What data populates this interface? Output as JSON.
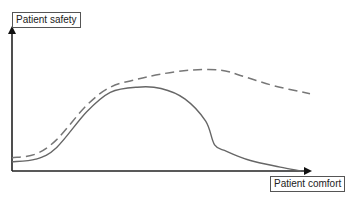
{
  "chart_data": {
    "type": "line",
    "title": "",
    "xlabel": "Patient comfort",
    "ylabel": "Patient safety",
    "grid": false,
    "legend": null,
    "axis_ticks": false,
    "x_range": [
      0,
      1
    ],
    "y_range": [
      0,
      1
    ],
    "series": [
      {
        "name": "solid curve",
        "style": "solid",
        "color": "#666666",
        "x": [
          0.0,
          0.08,
          0.15,
          0.25,
          0.33,
          0.42,
          0.5,
          0.58,
          0.65,
          0.68,
          0.72,
          0.8,
          0.9,
          0.97
        ],
        "y": [
          0.07,
          0.09,
          0.18,
          0.45,
          0.6,
          0.64,
          0.63,
          0.55,
          0.38,
          0.2,
          0.15,
          0.08,
          0.03,
          0.0
        ]
      },
      {
        "name": "dashed curve",
        "style": "dashed",
        "color": "#777777",
        "x": [
          0.0,
          0.08,
          0.15,
          0.25,
          0.33,
          0.42,
          0.5,
          0.6,
          0.7,
          0.78,
          0.88,
          1.0
        ],
        "y": [
          0.1,
          0.13,
          0.24,
          0.5,
          0.64,
          0.7,
          0.74,
          0.77,
          0.77,
          0.72,
          0.65,
          0.59
        ]
      }
    ]
  },
  "axes": {
    "y_label": "Patient safety",
    "x_label": "Patient comfort"
  }
}
